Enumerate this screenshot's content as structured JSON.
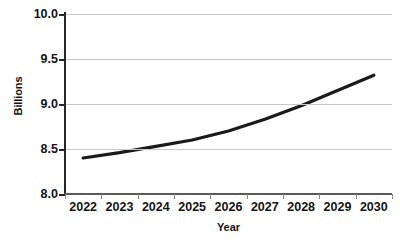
{
  "chart_data": {
    "type": "line",
    "title": "",
    "xlabel": "Year",
    "ylabel": "Billions",
    "categories": [
      "2022",
      "2023",
      "2024",
      "2025",
      "2026",
      "2027",
      "2028",
      "2029",
      "2030"
    ],
    "values": [
      8.4,
      8.46,
      8.53,
      8.6,
      8.7,
      8.83,
      8.98,
      9.15,
      9.32
    ],
    "series": [
      {
        "name": "World population",
        "values": [
          8.4,
          8.46,
          8.53,
          8.6,
          8.7,
          8.83,
          8.98,
          9.15,
          9.32
        ]
      }
    ],
    "ylim": [
      8.0,
      10.0
    ],
    "y_ticks": [
      "10.0",
      "9.5",
      "9.0",
      "8.5",
      "8.0"
    ],
    "y_tick_values": [
      10.0,
      9.5,
      9.0,
      8.5,
      8.0
    ],
    "grid": "horizontal",
    "legend": "none",
    "line_color": "#1a1a1a",
    "grid_color": "#c9c9c9",
    "axis_color": "#262626",
    "background": "#ffffff"
  }
}
